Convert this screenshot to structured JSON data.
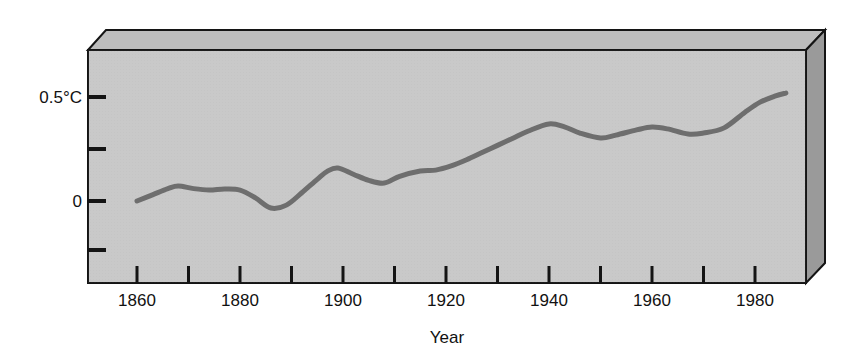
{
  "chart_data": {
    "type": "line",
    "title": "",
    "subtitle": "",
    "xlabel": "Year",
    "ylabel": "",
    "xlim": [
      1850,
      1989
    ],
    "ylim": [
      -0.36,
      0.63
    ],
    "grid": false,
    "legend": null,
    "y_unit": "°C",
    "y_tick_values": [
      0.5,
      0.25,
      0,
      -0.25
    ],
    "y_tick_labels": [
      "0.5°C",
      "",
      "0",
      ""
    ],
    "x_tick_values": [
      1860,
      1870,
      1880,
      1890,
      1900,
      1910,
      1920,
      1930,
      1940,
      1950,
      1960,
      1970,
      1980
    ],
    "x_tick_labels": [
      "1860",
      "",
      "1880",
      "",
      "1900",
      "",
      "1920",
      "",
      "1940",
      "",
      "1960",
      "",
      "1980"
    ],
    "series": [
      {
        "name": "Global temperature anomaly",
        "color": "#6e6e6e",
        "x": [
          1860,
          1863,
          1866,
          1868,
          1871,
          1874,
          1877,
          1880,
          1883,
          1886,
          1889,
          1892,
          1895,
          1897,
          1899,
          1902,
          1905,
          1908,
          1911,
          1915,
          1918,
          1921,
          1924,
          1927,
          1930,
          1933,
          1936,
          1940,
          1943,
          1946,
          1950,
          1953,
          1957,
          1960,
          1963,
          1967,
          1970,
          1974,
          1978,
          1981,
          1984,
          1986
        ],
        "values": [
          0.0,
          0.03,
          0.06,
          0.073,
          0.06,
          0.053,
          0.058,
          0.053,
          0.015,
          -0.034,
          -0.02,
          0.04,
          0.105,
          0.145,
          0.16,
          0.13,
          0.1,
          0.087,
          0.12,
          0.146,
          0.15,
          0.17,
          0.2,
          0.235,
          0.27,
          0.305,
          0.34,
          0.374,
          0.36,
          0.33,
          0.306,
          0.32,
          0.345,
          0.359,
          0.35,
          0.325,
          0.33,
          0.355,
          0.43,
          0.48,
          0.51,
          0.524
        ]
      }
    ]
  },
  "axes": {
    "y_label_upper": "0.5°C",
    "y_label_zero": "0",
    "x_title": "Year",
    "x_labels": [
      "1860",
      "1880",
      "1900",
      "1920",
      "1940",
      "1960",
      "1980"
    ]
  },
  "colors": {
    "plot_background": "#c9c9c9",
    "panel_top": "#bdbdbd",
    "panel_side": "#9a9a9a",
    "line": "#6e6e6e",
    "axis": "#141414",
    "text": "#111111",
    "page_background": "#ffffff"
  }
}
